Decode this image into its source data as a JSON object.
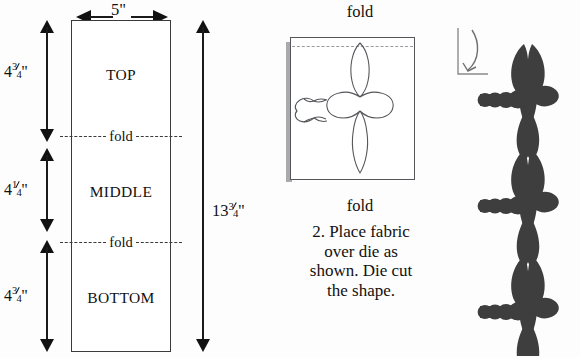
{
  "figure": {
    "title_hidden": "Die cutting instructions diagram",
    "units": "inches"
  },
  "panel_strip": {
    "width_label": {
      "whole": "5",
      "has_fraction": false,
      "unit": "\"",
      "text": "5\""
    },
    "total_height_label": {
      "whole": "13",
      "num": "3",
      "den": "4",
      "unit": "\"",
      "text": "13¾\""
    },
    "sections": [
      {
        "name": "TOP",
        "label": "TOP",
        "dimension": {
          "whole": "4",
          "num": "3",
          "den": "4",
          "unit": "\"",
          "text": "4¾\""
        }
      },
      {
        "name": "MIDDLE",
        "label": "MIDDLE",
        "dimension": {
          "whole": "4",
          "num": "1",
          "den": "4",
          "unit": "\"",
          "text": "4¼\""
        }
      },
      {
        "name": "BOTTOM",
        "label": "BOTTOM",
        "dimension": {
          "whole": "4",
          "num": "3",
          "den": "4",
          "unit": "\"",
          "text": "4¾\""
        }
      }
    ],
    "fold_lines": [
      {
        "label": "fold"
      },
      {
        "label": "fold"
      }
    ]
  },
  "panel_fabric": {
    "top_label": "fold",
    "bottom_label": "fold",
    "caption": "2. Place fabric over die as shown. Die cut the shape.",
    "caption_lines": [
      "2. Place fabric",
      "over die as",
      "shown. Die cut",
      "the shape."
    ],
    "shape_name": "dragonfly-outline"
  },
  "panel_die": {
    "shape_name": "dragonfly-silhouette",
    "shape_count": 3,
    "marker_name": "corner-alignment-marker"
  },
  "colors": {
    "ink": "#111111",
    "line": "#3a3a3a",
    "outline_grey": "#55565a",
    "silhouette": "#3e3e3f",
    "fabric_shadow": "#a9aaab",
    "dash_grey": "#9a9b9e",
    "background": "#fdfdfd"
  },
  "icons": {
    "arrow_up": "arrow-up-icon",
    "arrow_down": "arrow-down-icon",
    "arrow_left": "arrow-left-icon",
    "arrow_right": "arrow-right-icon"
  }
}
